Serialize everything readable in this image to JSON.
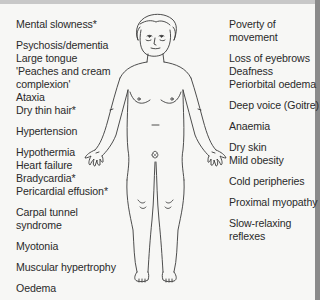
{
  "diagram": {
    "left_labels": [
      {
        "text": "Mental slowness*",
        "top": 18
      },
      {
        "text": "Psychosis/dementia",
        "top": 39
      },
      {
        "text": "Large tongue",
        "top": 52
      },
      {
        "text": "'Peaches and cream",
        "top": 65
      },
      {
        "text": "complexion'",
        "top": 78
      },
      {
        "text": "Ataxia",
        "top": 91
      },
      {
        "text": "Dry thin hair*",
        "top": 104
      },
      {
        "text": "Hypertension",
        "top": 125
      },
      {
        "text": "Hypothermia",
        "top": 146
      },
      {
        "text": "Heart failure",
        "top": 159
      },
      {
        "text": "Bradycardia*",
        "top": 172
      },
      {
        "text": "Pericardial effusion*",
        "top": 185
      },
      {
        "text": "Carpal tunnel",
        "top": 206
      },
      {
        "text": "syndrome",
        "top": 219
      },
      {
        "text": "Myotonia",
        "top": 240
      },
      {
        "text": "Muscular hypertrophy",
        "top": 261
      },
      {
        "text": "Oedema",
        "top": 282
      }
    ],
    "right_labels": [
      {
        "text": "Poverty of",
        "top": 18
      },
      {
        "text": "movement",
        "top": 31
      },
      {
        "text": "Loss of eyebrows",
        "top": 52
      },
      {
        "text": "Deafness",
        "top": 65
      },
      {
        "text": "Periorbital oedema",
        "top": 78
      },
      {
        "text": "Deep voice (Goitre)",
        "top": 99
      },
      {
        "text": "Anaemia",
        "top": 120
      },
      {
        "text": "Dry skin",
        "top": 141
      },
      {
        "text": "Mild obesity",
        "top": 154
      },
      {
        "text": "Cold peripheries",
        "top": 175
      },
      {
        "text": "Proximal myopathy",
        "top": 196
      },
      {
        "text": "Slow-relaxing",
        "top": 217
      },
      {
        "text": "reflexes",
        "top": 230
      }
    ]
  }
}
